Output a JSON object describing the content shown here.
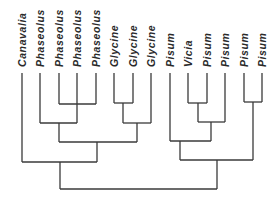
{
  "diagram": {
    "type": "dendrogram",
    "line_color": "#3a3a3a",
    "label_color": "#2a2a2a",
    "leaves": [
      {
        "label": "Canavalia",
        "x": 22
      },
      {
        "label": "Phaseolus",
        "x": 40
      },
      {
        "label": "Phaseolus",
        "x": 59
      },
      {
        "label": "Phaseolus",
        "x": 77
      },
      {
        "label": "Phaseolus",
        "x": 96
      },
      {
        "label": "Glycine",
        "x": 114
      },
      {
        "label": "Glycine",
        "x": 133
      },
      {
        "label": "Glycine",
        "x": 151
      },
      {
        "label": "Pisum",
        "x": 170
      },
      {
        "label": "Vicia",
        "x": 188
      },
      {
        "label": "Pisum",
        "x": 207
      },
      {
        "label": "Pisum",
        "x": 225
      },
      {
        "label": "Pisum",
        "x": 244
      },
      {
        "label": "Pisum",
        "x": 262
      }
    ],
    "leaf_top_y": 73,
    "nodes": [
      {
        "id": "A",
        "left": {
          "x": 59,
          "y": 73
        },
        "right": {
          "x": 96,
          "y": 73
        },
        "y": 104,
        "cx": 77
      },
      {
        "id": "B",
        "left": {
          "x": 40,
          "y": 73
        },
        "right": {
          "x": 77,
          "y": 73
        },
        "y": 123,
        "cx": 59
      },
      {
        "id": "C",
        "left": {
          "x": 114,
          "y": 73
        },
        "right": {
          "x": 133,
          "y": 73
        },
        "y": 103,
        "cx": 123
      },
      {
        "id": "D",
        "left": {
          "x": 123,
          "y": 103
        },
        "right": {
          "x": 151,
          "y": 73
        },
        "y": 123,
        "cx": 137
      },
      {
        "id": "E",
        "left": {
          "x": 59,
          "y": 123
        },
        "right": {
          "x": 137,
          "y": 123
        },
        "y": 142,
        "cx": 97
      },
      {
        "id": "F",
        "left": {
          "x": 22,
          "y": 73
        },
        "right": {
          "x": 97,
          "y": 142
        },
        "y": 162,
        "cx": 60
      },
      {
        "id": "G",
        "left": {
          "x": 188,
          "y": 73
        },
        "right": {
          "x": 207,
          "y": 73
        },
        "y": 103,
        "cx": 198
      },
      {
        "id": "H",
        "left": {
          "x": 198,
          "y": 103
        },
        "right": {
          "x": 225,
          "y": 73
        },
        "y": 122,
        "cx": 211
      },
      {
        "id": "I",
        "left": {
          "x": 170,
          "y": 73
        },
        "right": {
          "x": 211,
          "y": 122
        },
        "y": 141,
        "cx": 180
      },
      {
        "id": "J",
        "left": {
          "x": 244,
          "y": 73
        },
        "right": {
          "x": 262,
          "y": 73
        },
        "y": 102,
        "cx": 253
      },
      {
        "id": "K",
        "left": {
          "x": 180,
          "y": 141
        },
        "right": {
          "x": 253,
          "y": 102
        },
        "y": 160,
        "cx": 217
      },
      {
        "id": "Root",
        "left": {
          "x": 60,
          "y": 162
        },
        "right": {
          "x": 217,
          "y": 160
        },
        "y": 189,
        "cx": 138
      }
    ]
  }
}
